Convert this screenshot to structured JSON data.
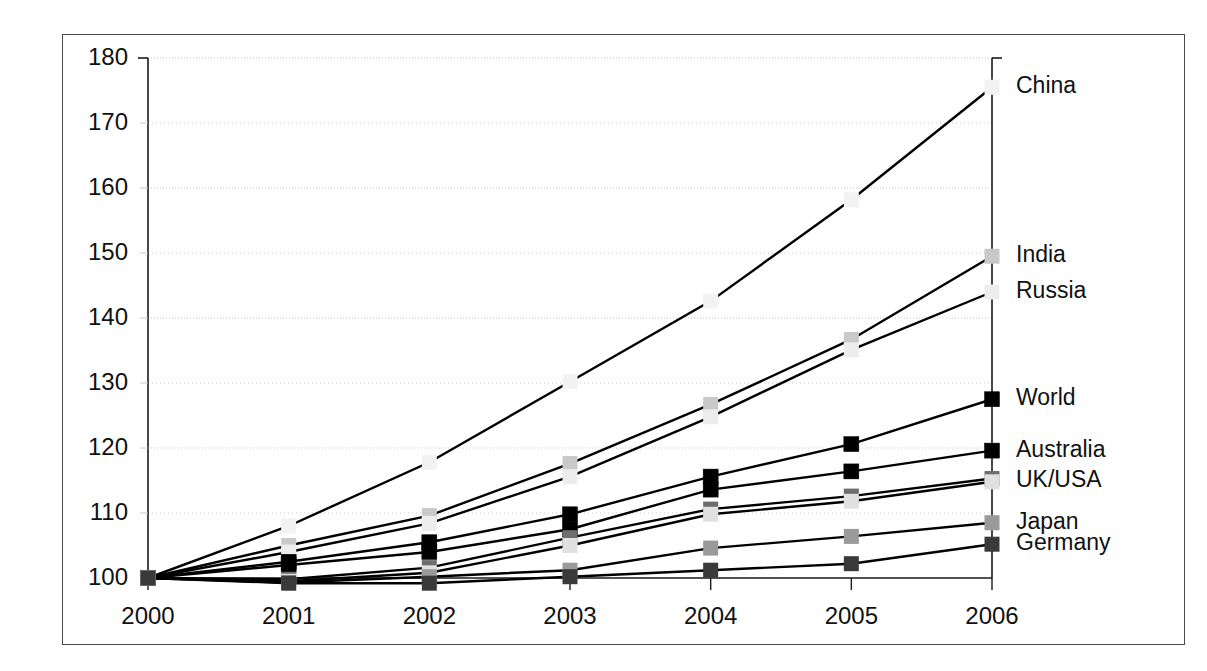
{
  "chart_data": {
    "type": "line",
    "title": "",
    "xlabel": "",
    "ylabel": "",
    "x": [
      2000,
      2001,
      2002,
      2003,
      2004,
      2005,
      2006
    ],
    "categories": [
      "2000",
      "2001",
      "2002",
      "2003",
      "2004",
      "2005",
      "2006"
    ],
    "xtick_labels": [
      "2000",
      "2001",
      "2002",
      "2003",
      "2004",
      "2005",
      "2006"
    ],
    "ytick_labels": [
      "100",
      "110",
      "120",
      "130",
      "140",
      "150",
      "160",
      "170",
      "180"
    ],
    "yticks": [
      100,
      110,
      120,
      130,
      140,
      150,
      160,
      170,
      180
    ],
    "ylim": [
      100,
      180
    ],
    "xlim": [
      2000,
      2006
    ],
    "grid": "horizontal-dotted",
    "legend_position": "right-end-of-line",
    "index_base": "2000 = 100",
    "series": [
      {
        "name": "China",
        "label": "China",
        "values": [
          100,
          108.0,
          117.8,
          130.2,
          142.6,
          158.2,
          175.5
        ],
        "marker_color": "#f2f2f2",
        "line_color": "#000000"
      },
      {
        "name": "India",
        "label": "India",
        "values": [
          100,
          105.0,
          109.6,
          117.6,
          126.7,
          136.7,
          149.5
        ],
        "marker_color": "#c9c9c9",
        "line_color": "#000000"
      },
      {
        "name": "Russia",
        "label": "Russia",
        "values": [
          100,
          104.0,
          108.4,
          115.6,
          124.8,
          135.1,
          144.0
        ],
        "marker_color": "#ededed",
        "line_color": "#000000"
      },
      {
        "name": "World",
        "label": "World",
        "values": [
          100,
          102.5,
          105.5,
          109.8,
          115.6,
          120.6,
          127.5
        ],
        "marker_color": "#000000",
        "line_color": "#000000"
      },
      {
        "name": "Australia",
        "label": "Australia",
        "values": [
          100,
          102.0,
          104.0,
          107.5,
          113.6,
          116.4,
          119.6
        ],
        "marker_color": "#000000",
        "line_color": "#000000"
      },
      {
        "name": "UK",
        "label": "UK/USA",
        "values": [
          100,
          99.8,
          101.6,
          106.2,
          110.6,
          112.6,
          115.3
        ],
        "marker_color": "#6e6e6e",
        "line_color": "#000000"
      },
      {
        "name": "USA",
        "label": "",
        "values": [
          100,
          99.5,
          100.8,
          105.0,
          109.8,
          111.8,
          114.8
        ],
        "marker_color": "#e0e0e0",
        "line_color": "#000000"
      },
      {
        "name": "Japan",
        "label": "Japan",
        "values": [
          100,
          99.3,
          100.2,
          101.2,
          104.6,
          106.4,
          108.5
        ],
        "marker_color": "#9a9a9a",
        "line_color": "#000000"
      },
      {
        "name": "Germany",
        "label": "Germany",
        "values": [
          100,
          99.2,
          99.2,
          100.2,
          101.2,
          102.2,
          105.2
        ],
        "marker_color": "#3a3a3a",
        "line_color": "#000000"
      }
    ],
    "end_labels": [
      {
        "text": "China",
        "value": 175.5
      },
      {
        "text": "India",
        "value": 149.5
      },
      {
        "text": "Russia",
        "value": 144.0
      },
      {
        "text": "World",
        "value": 127.5
      },
      {
        "text": "Australia",
        "value": 119.6
      },
      {
        "text": "UK/USA",
        "value": 115.0
      },
      {
        "text": "Japan",
        "value": 108.5
      },
      {
        "text": "Germany",
        "value": 105.2
      }
    ]
  },
  "colors": {
    "axis": "#1a1a1a",
    "grid": "#c8c8c8",
    "frame": "#4a4a4a",
    "background": "#ffffff",
    "text": "#111111"
  }
}
